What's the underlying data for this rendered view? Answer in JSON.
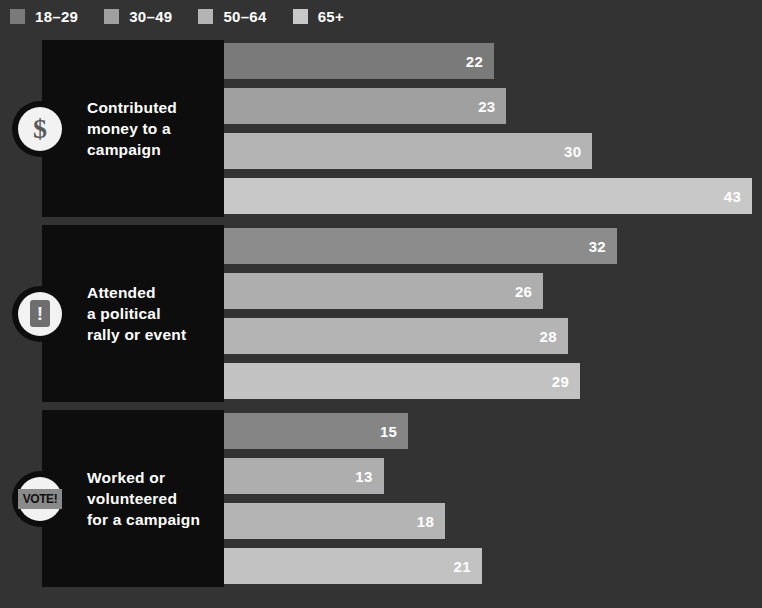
{
  "legend": {
    "items": [
      {
        "label": "18–29",
        "color": "#7a7a7a"
      },
      {
        "label": "30–49",
        "color": "#a0a0a0"
      },
      {
        "label": "50–64",
        "color": "#b4b4b4"
      },
      {
        "label": "65+",
        "color": "#c8c8c8"
      }
    ]
  },
  "chart_data": {
    "type": "bar",
    "orientation": "horizontal",
    "title": "",
    "xlabel": "",
    "ylabel": "",
    "xlim": [
      0,
      45
    ],
    "grid": false,
    "legend_position": "top-left",
    "categories": [
      "Contributed money to a campaign",
      "Attended a political rally or event",
      "Worked or volunteered for a campaign"
    ],
    "series": [
      {
        "name": "18–29",
        "color": "#7a7a7a",
        "values": [
          22,
          32,
          15
        ]
      },
      {
        "name": "30–49",
        "color": "#a0a0a0",
        "values": [
          23,
          26,
          13
        ]
      },
      {
        "name": "50–64",
        "color": "#b4b4b4",
        "values": [
          30,
          28,
          18
        ]
      },
      {
        "name": "65+",
        "color": "#c8c8c8",
        "values": [
          43,
          29,
          21
        ]
      }
    ]
  },
  "groups": [
    {
      "icon": "dollar-sign-icon",
      "icon_glyph": "$",
      "label_lines": [
        "Contributed",
        "money to a",
        "campaign"
      ],
      "bars": [
        {
          "series": "18–29",
          "value": 22,
          "value_text": "22",
          "color": "#7a7a7a"
        },
        {
          "series": "30–49",
          "value": 23,
          "value_text": "23",
          "color": "#a0a0a0"
        },
        {
          "series": "50–64",
          "value": 30,
          "value_text": "30",
          "color": "#b4b4b4"
        },
        {
          "series": "65+",
          "value": 43,
          "value_text": "43",
          "color": "#c8c8c8"
        }
      ]
    },
    {
      "icon": "exclamation-mark-icon",
      "icon_glyph": "!",
      "label_lines": [
        "Attended",
        "a political",
        "rally or event"
      ],
      "bars": [
        {
          "series": "18–29",
          "value": 32,
          "value_text": "32",
          "color": "#8c8c8c"
        },
        {
          "series": "30–49",
          "value": 26,
          "value_text": "26",
          "color": "#aeaeae"
        },
        {
          "series": "50–64",
          "value": 28,
          "value_text": "28",
          "color": "#b4b4b4"
        },
        {
          "series": "65+",
          "value": 29,
          "value_text": "29",
          "color": "#c2c2c2"
        }
      ]
    },
    {
      "icon": "vote-badge-icon",
      "icon_glyph": "VOTE!",
      "label_lines": [
        "Worked or",
        "volunteered",
        "for a campaign"
      ],
      "bars": [
        {
          "series": "18–29",
          "value": 15,
          "value_text": "15",
          "color": "#858585"
        },
        {
          "series": "30–49",
          "value": 13,
          "value_text": "13",
          "color": "#aeaeae"
        },
        {
          "series": "50–64",
          "value": 18,
          "value_text": "18",
          "color": "#b4b4b4"
        },
        {
          "series": "65+",
          "value": 21,
          "value_text": "21",
          "color": "#c2c2c2"
        }
      ]
    }
  ],
  "layout": {
    "background": "#333333",
    "panel_color": "#0d0d0d",
    "bar_origin_x": 224,
    "px_per_unit": 12.28,
    "bar_height": 36,
    "bar_gap": 9,
    "group_tops": [
      8,
      193,
      378
    ],
    "group_height": 177
  }
}
